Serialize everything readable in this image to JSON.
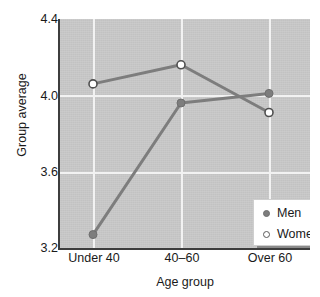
{
  "chart_data": {
    "type": "line",
    "title": "",
    "xlabel": "Age group",
    "ylabel": "Group average",
    "categories": [
      "Under 40",
      "40–60",
      "Over 60"
    ],
    "series": [
      {
        "name": "Men",
        "values": [
          3.27,
          3.96,
          4.01
        ],
        "marker": "filled-circle",
        "color": "#7d7d7d"
      },
      {
        "name": "Women",
        "values": [
          4.06,
          4.16,
          3.91
        ],
        "marker": "open-circle",
        "color": "#7d7d7d"
      }
    ],
    "ylim": [
      3.2,
      4.4
    ],
    "yticks": [
      "3.2",
      "3.6",
      "4.0",
      "4.4"
    ],
    "ytick_values": [
      3.2,
      3.6,
      4.0,
      4.4
    ],
    "grid": true,
    "grid_color": "#f2f2f2",
    "plot_background": "#c9c9c9",
    "legend_position": "inside-bottom-right",
    "legend_entries": [
      "Men",
      "Women"
    ]
  },
  "legend": {
    "men_label": "Men",
    "women_label": "Women"
  },
  "axes": {
    "y_title": "Group average",
    "x_title": "Age group"
  }
}
